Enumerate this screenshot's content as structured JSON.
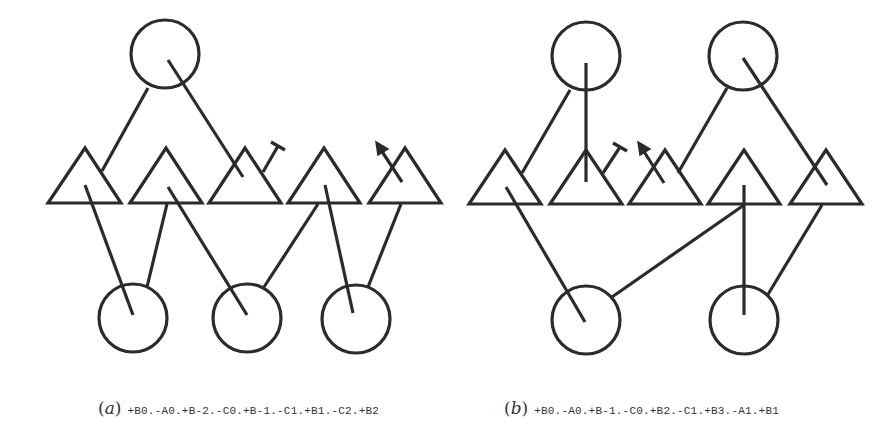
{
  "panels": [
    {
      "id": "a",
      "label": "a",
      "sequence": "+B0.-A0.+B-2.-C0.+B-1.-C1.+B1.-C2.+B2",
      "top_circles": 1,
      "triangles": 5,
      "bottom_circles": 3
    },
    {
      "id": "b",
      "label": "b",
      "sequence": "+B0.-A0.+B-1.-C0.+B2.-C1.+B3.-A1.+B1",
      "top_circles": 2,
      "triangles": 5,
      "bottom_circles": 2
    }
  ],
  "legend": {
    "open_paren": "(",
    "close_paren": ")"
  }
}
